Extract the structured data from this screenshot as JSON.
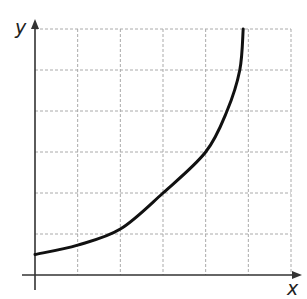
{
  "chart_data": {
    "type": "line",
    "title": "",
    "xlabel": "x",
    "ylabel": "y",
    "grid": true,
    "grid_style": "dashed",
    "grid_columns": 6,
    "grid_rows": 6,
    "xlim": [
      0,
      6
    ],
    "ylim": [
      0,
      6
    ],
    "tick_labels": false,
    "series": [
      {
        "name": "curve",
        "description": "increasing, concave-up curve starting above origin and rising steeply near x≈4.9",
        "x": [
          0,
          1,
          2,
          3,
          4,
          4.5,
          4.8,
          4.88
        ],
        "y": [
          0.5,
          0.73,
          1.12,
          2.0,
          3.0,
          4.0,
          5.0,
          6.0
        ]
      }
    ]
  },
  "colors": {
    "curve": "#111111",
    "axes": "#333333",
    "grid": "#aaaaaa"
  }
}
